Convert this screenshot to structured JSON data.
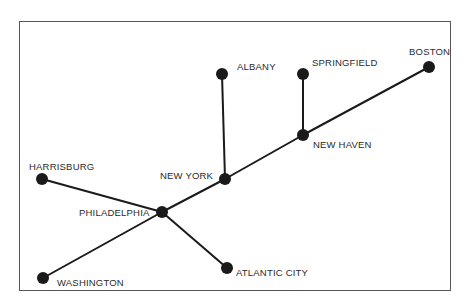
{
  "diagram": {
    "type": "network-map",
    "colors": {
      "line": "#1a1a1a",
      "node": "#1a1a1a",
      "frame": "#555555",
      "text": "#2a2a2a"
    },
    "nodes": [
      {
        "id": "albany",
        "label": "ALBANY",
        "x": 222,
        "y": 74
      },
      {
        "id": "springfield",
        "label": "SPRINGFIELD",
        "x": 303,
        "y": 74
      },
      {
        "id": "boston",
        "label": "BOSTON",
        "x": 429,
        "y": 67
      },
      {
        "id": "new-haven",
        "label": "NEW HAVEN",
        "x": 303,
        "y": 135
      },
      {
        "id": "new-york",
        "label": "NEW YORK",
        "x": 225,
        "y": 179
      },
      {
        "id": "harrisburg",
        "label": "HARRISBURG",
        "x": 42,
        "y": 179
      },
      {
        "id": "philadelphia",
        "label": "PHILADELPHIA",
        "x": 162,
        "y": 212
      },
      {
        "id": "washington",
        "label": "WASHINGTON",
        "x": 43,
        "y": 278
      },
      {
        "id": "atlantic-city",
        "label": "ATLANTIC CITY",
        "x": 227,
        "y": 268
      }
    ],
    "edges": [
      [
        "albany",
        "new-york"
      ],
      [
        "springfield",
        "new-haven"
      ],
      [
        "boston",
        "new-haven"
      ],
      [
        "new-haven",
        "new-york"
      ],
      [
        "new-york",
        "philadelphia"
      ],
      [
        "harrisburg",
        "philadelphia"
      ],
      [
        "philadelphia",
        "washington"
      ],
      [
        "philadelphia",
        "atlantic-city"
      ]
    ],
    "labels": {
      "albany": "ALBANY",
      "springfield": "SPRINGFIELD",
      "boston": "BOSTON",
      "new_haven": "NEW HAVEN",
      "new_york": "NEW YORK",
      "harrisburg": "HARRISBURG",
      "philadelphia": "PHILADELPHIA",
      "washington": "WASHINGTON",
      "atlantic_city": "ATLANTIC CITY"
    }
  }
}
